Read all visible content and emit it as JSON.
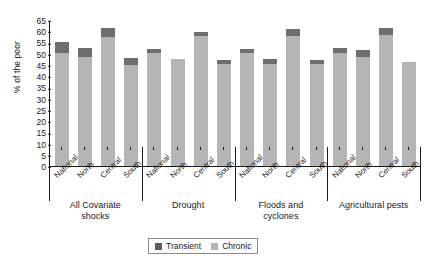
{
  "chart_data": {
    "type": "bar",
    "stacked": true,
    "title": "",
    "xlabel": "",
    "ylabel": "% of the poor",
    "ylim": [
      0,
      65
    ],
    "yticks": [
      0,
      5,
      10,
      15,
      20,
      25,
      30,
      35,
      40,
      45,
      50,
      55,
      60,
      65
    ],
    "grid": false,
    "legend_position": "bottom-center",
    "categories": [
      "National",
      "North",
      "Central",
      "South",
      "National",
      "North",
      "Central",
      "South",
      "National",
      "North",
      "Central",
      "South",
      "National",
      "North",
      "Central",
      "South"
    ],
    "groups": [
      {
        "label": "All Covariate shocks",
        "label_lines": [
          "All Covariate",
          "shocks"
        ],
        "categories": [
          "National",
          "North",
          "Central",
          "South"
        ]
      },
      {
        "label": "Drought",
        "label_lines": [
          "Drought"
        ],
        "categories": [
          "National",
          "North",
          "Central",
          "South"
        ]
      },
      {
        "label": "Floods and cyclones",
        "label_lines": [
          "Floods and",
          "cyclones"
        ],
        "categories": [
          "National",
          "North",
          "Central",
          "South"
        ]
      },
      {
        "label": "Agricultural pests",
        "label_lines": [
          "Agricultural pests"
        ],
        "categories": [
          "National",
          "North",
          "Central",
          "South"
        ]
      }
    ],
    "series": [
      {
        "name": "Chronic",
        "color": "#b5b5b5",
        "values": [
          50.5,
          48.5,
          57.5,
          45.0,
          50.5,
          47.5,
          58.0,
          45.5,
          50.5,
          45.5,
          58.0,
          45.5,
          50.5,
          48.5,
          58.5,
          46.5
        ]
      },
      {
        "name": "Transient",
        "color": "#6e6e6e",
        "values": [
          4.5,
          4.0,
          4.0,
          3.0,
          1.5,
          0.0,
          1.5,
          1.5,
          1.5,
          2.0,
          3.0,
          1.5,
          2.0,
          3.0,
          3.0,
          0.0
        ]
      }
    ],
    "totals": [
      55.0,
      52.5,
      61.5,
      48.0,
      52.0,
      47.5,
      59.5,
      47.0,
      52.0,
      47.5,
      61.0,
      47.0,
      52.5,
      51.5,
      61.5,
      46.5
    ]
  },
  "legend": {
    "items": [
      {
        "label": "Transient",
        "color": "#5f5f5f"
      },
      {
        "label": "Chronic",
        "color": "#b5b5b5"
      }
    ]
  }
}
